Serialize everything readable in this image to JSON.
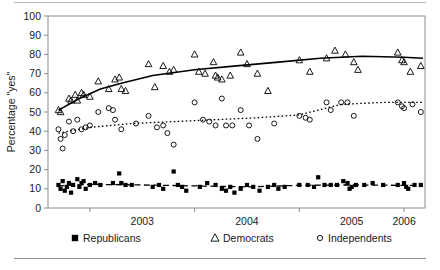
{
  "chart_data": {
    "type": "scatter",
    "title": "",
    "xlabel": "",
    "ylabel": "Percentage \"yes\"",
    "xlim": [
      2002.6,
      2006.2
    ],
    "ylim": [
      0,
      100
    ],
    "yticks": [
      0,
      10,
      20,
      30,
      40,
      50,
      60,
      70,
      80,
      90,
      100
    ],
    "xticks": [
      2003,
      2004,
      2005,
      2006
    ],
    "xtick_labels": [
      "2003",
      "2004",
      "2005",
      "2006"
    ],
    "xtick_label_positions": [
      2003.5,
      2004.5,
      2005.5,
      2006.0
    ],
    "grid": false,
    "legend_position": "bottom",
    "series": [
      {
        "name": "Republicans",
        "marker": "filled-square",
        "color": "#000000",
        "line_style": "dashed",
        "points": [
          [
            2002.7,
            12
          ],
          [
            2002.72,
            10
          ],
          [
            2002.74,
            14
          ],
          [
            2002.76,
            9
          ],
          [
            2002.78,
            11
          ],
          [
            2002.8,
            13
          ],
          [
            2002.82,
            8
          ],
          [
            2002.84,
            12
          ],
          [
            2002.88,
            15
          ],
          [
            2002.9,
            11
          ],
          [
            2002.92,
            13
          ],
          [
            2002.94,
            14
          ],
          [
            2002.96,
            10
          ],
          [
            2003.0,
            12
          ],
          [
            2003.05,
            13
          ],
          [
            2003.1,
            12
          ],
          [
            2003.22,
            13
          ],
          [
            2003.28,
            18
          ],
          [
            2003.3,
            13
          ],
          [
            2003.34,
            12
          ],
          [
            2003.4,
            12
          ],
          [
            2003.6,
            11
          ],
          [
            2003.66,
            12
          ],
          [
            2003.7,
            10
          ],
          [
            2003.8,
            19
          ],
          [
            2003.84,
            12
          ],
          [
            2003.88,
            11
          ],
          [
            2003.92,
            9
          ],
          [
            2004.05,
            11
          ],
          [
            2004.12,
            13
          ],
          [
            2004.2,
            12
          ],
          [
            2004.26,
            10
          ],
          [
            2004.3,
            9
          ],
          [
            2004.34,
            11
          ],
          [
            2004.38,
            8
          ],
          [
            2004.44,
            10
          ],
          [
            2004.5,
            12
          ],
          [
            2004.56,
            11
          ],
          [
            2004.62,
            9
          ],
          [
            2004.7,
            11
          ],
          [
            2004.76,
            12
          ],
          [
            2004.8,
            10
          ],
          [
            2004.86,
            11
          ],
          [
            2005.0,
            12
          ],
          [
            2005.08,
            12
          ],
          [
            2005.14,
            11
          ],
          [
            2005.18,
            16
          ],
          [
            2005.24,
            12
          ],
          [
            2005.3,
            12
          ],
          [
            2005.36,
            12
          ],
          [
            2005.42,
            14
          ],
          [
            2005.46,
            13
          ],
          [
            2005.48,
            10
          ],
          [
            2005.5,
            11
          ],
          [
            2005.54,
            12
          ],
          [
            2005.62,
            12
          ],
          [
            2005.7,
            13
          ],
          [
            2005.8,
            12
          ],
          [
            2005.94,
            12
          ],
          [
            2006.0,
            13
          ],
          [
            2006.02,
            11
          ],
          [
            2006.04,
            10
          ],
          [
            2006.1,
            12
          ],
          [
            2006.16,
            12
          ]
        ],
        "trend": [
          [
            2002.7,
            11.5
          ],
          [
            2003.0,
            12.3
          ],
          [
            2003.5,
            12.0
          ],
          [
            2004.0,
            11.5
          ],
          [
            2004.5,
            11.0
          ],
          [
            2005.0,
            11.8
          ],
          [
            2005.5,
            12.0
          ],
          [
            2006.0,
            11.8
          ],
          [
            2006.18,
            11.6
          ]
        ]
      },
      {
        "name": "Democrats",
        "marker": "open-triangle",
        "color": "#000000",
        "line_style": "solid",
        "points": [
          [
            2002.7,
            51
          ],
          [
            2002.72,
            50
          ],
          [
            2002.8,
            57
          ],
          [
            2002.82,
            56
          ],
          [
            2002.86,
            59
          ],
          [
            2002.88,
            56
          ],
          [
            2002.92,
            60
          ],
          [
            2002.94,
            59
          ],
          [
            2003.0,
            58
          ],
          [
            2003.08,
            66
          ],
          [
            2003.18,
            62
          ],
          [
            2003.24,
            67
          ],
          [
            2003.28,
            68
          ],
          [
            2003.3,
            62
          ],
          [
            2003.34,
            61
          ],
          [
            2003.56,
            75
          ],
          [
            2003.62,
            63
          ],
          [
            2003.7,
            74
          ],
          [
            2003.76,
            71
          ],
          [
            2003.8,
            72
          ],
          [
            2004.0,
            80
          ],
          [
            2004.04,
            71
          ],
          [
            2004.1,
            70
          ],
          [
            2004.18,
            76
          ],
          [
            2004.2,
            69
          ],
          [
            2004.22,
            68
          ],
          [
            2004.26,
            67
          ],
          [
            2004.34,
            69
          ],
          [
            2004.44,
            81
          ],
          [
            2004.5,
            75
          ],
          [
            2004.6,
            70
          ],
          [
            2004.7,
            61
          ],
          [
            2005.0,
            77
          ],
          [
            2005.1,
            71
          ],
          [
            2005.26,
            78
          ],
          [
            2005.34,
            82
          ],
          [
            2005.44,
            80
          ],
          [
            2005.52,
            76
          ],
          [
            2005.56,
            72
          ],
          [
            2005.94,
            81
          ],
          [
            2005.98,
            77
          ],
          [
            2006.0,
            76
          ],
          [
            2006.06,
            71
          ],
          [
            2006.16,
            74
          ]
        ],
        "trend": [
          [
            2002.7,
            51
          ],
          [
            2002.9,
            57
          ],
          [
            2003.1,
            62
          ],
          [
            2003.3,
            65
          ],
          [
            2003.6,
            69
          ],
          [
            2004.0,
            72
          ],
          [
            2004.4,
            74
          ],
          [
            2004.8,
            76
          ],
          [
            2005.2,
            78
          ],
          [
            2005.6,
            79
          ],
          [
            2006.0,
            78.5
          ],
          [
            2006.18,
            78
          ]
        ]
      },
      {
        "name": "Independents",
        "marker": "open-circle",
        "color": "#000000",
        "line_style": "dotted",
        "points": [
          [
            2002.7,
            41
          ],
          [
            2002.72,
            36
          ],
          [
            2002.74,
            31
          ],
          [
            2002.76,
            38
          ],
          [
            2002.8,
            45
          ],
          [
            2002.84,
            40
          ],
          [
            2002.88,
            46
          ],
          [
            2002.92,
            41
          ],
          [
            2002.96,
            42
          ],
          [
            2003.0,
            43
          ],
          [
            2003.08,
            50
          ],
          [
            2003.18,
            52
          ],
          [
            2003.22,
            51
          ],
          [
            2003.24,
            46
          ],
          [
            2003.3,
            41
          ],
          [
            2003.44,
            44
          ],
          [
            2003.56,
            48
          ],
          [
            2003.64,
            42
          ],
          [
            2003.7,
            43
          ],
          [
            2003.74,
            39
          ],
          [
            2003.8,
            33
          ],
          [
            2004.0,
            55
          ],
          [
            2004.08,
            46
          ],
          [
            2004.14,
            45
          ],
          [
            2004.2,
            43
          ],
          [
            2004.26,
            57
          ],
          [
            2004.3,
            43
          ],
          [
            2004.36,
            43
          ],
          [
            2004.44,
            51
          ],
          [
            2004.52,
            43
          ],
          [
            2004.6,
            36
          ],
          [
            2004.76,
            44
          ],
          [
            2005.0,
            48
          ],
          [
            2005.06,
            47
          ],
          [
            2005.1,
            46
          ],
          [
            2005.26,
            55
          ],
          [
            2005.3,
            51
          ],
          [
            2005.4,
            55
          ],
          [
            2005.46,
            55
          ],
          [
            2005.52,
            48
          ],
          [
            2005.94,
            55
          ],
          [
            2005.98,
            53
          ],
          [
            2006.0,
            52
          ],
          [
            2006.08,
            54
          ],
          [
            2006.16,
            50
          ]
        ],
        "trend": [
          [
            2002.7,
            39
          ],
          [
            2003.0,
            42
          ],
          [
            2003.4,
            44
          ],
          [
            2003.8,
            45
          ],
          [
            2004.2,
            46
          ],
          [
            2004.6,
            47
          ],
          [
            2005.0,
            48.5
          ],
          [
            2005.4,
            54
          ],
          [
            2005.8,
            55
          ],
          [
            2006.18,
            55
          ]
        ]
      }
    ]
  },
  "legend": {
    "items": [
      {
        "label": "Republicans",
        "marker": "filled-square"
      },
      {
        "label": "Democrats",
        "marker": "open-triangle"
      },
      {
        "label": "Independents",
        "marker": "open-circle"
      }
    ]
  }
}
